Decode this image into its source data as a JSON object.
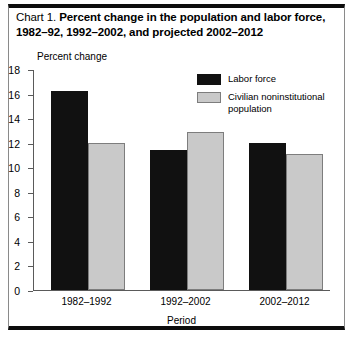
{
  "title": {
    "lead": "Chart 1.",
    "main": "Percent change in the population and labor force, 1982–92, 1992–2002, and projected 2002–2012"
  },
  "chart_data": {
    "type": "bar",
    "title": "Chart 1.  Percent change in the population and labor force, 1982–92, 1992–2002, and projected 2002–2012",
    "xlabel": "Period",
    "ylabel": "Percent change",
    "ylim": [
      0,
      18
    ],
    "yticks": [
      0,
      2,
      4,
      6,
      8,
      10,
      12,
      14,
      16,
      18
    ],
    "ytick_labels": [
      "0",
      "2",
      "4",
      "6",
      "8",
      "10",
      "12",
      "14",
      "16",
      "18"
    ],
    "grid": false,
    "legend_position": "upper right",
    "categories": [
      "1982–1992",
      "1992–2002",
      "2002–2012"
    ],
    "series": [
      {
        "name": "Labor force",
        "color": "#111111",
        "values": [
          16.2,
          11.4,
          12.0
        ]
      },
      {
        "name": "Civilian noninstitutional population",
        "color": "#c9c9c9",
        "values": [
          12.0,
          12.9,
          11.1
        ]
      }
    ]
  },
  "legend": {
    "items": [
      {
        "label": "Labor force"
      },
      {
        "label": "Civilian noninstitutional population"
      }
    ]
  }
}
